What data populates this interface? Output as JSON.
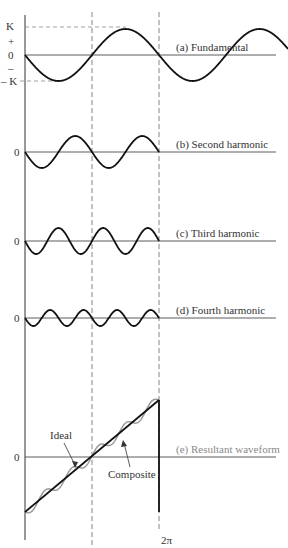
{
  "diagram": {
    "axis_labels": {
      "K": "K",
      "plus": "+",
      "zero": "0",
      "minus": "–",
      "neg_K": "– K",
      "two_pi": "2π"
    },
    "panels": [
      {
        "id": "a",
        "label": "(a) Fundamental",
        "harmonic": 1,
        "amplitude_px": 26,
        "baseline_y": 55
      },
      {
        "id": "b",
        "label": "(b) Second harmonic",
        "harmonic": 2,
        "amplitude_px": 16,
        "baseline_y": 152
      },
      {
        "id": "c",
        "label": "(c) Third harmonic",
        "harmonic": 3,
        "amplitude_px": 13,
        "baseline_y": 241
      },
      {
        "id": "d",
        "label": "(d) Fourth harmonic",
        "harmonic": 4,
        "amplitude_px": 8,
        "baseline_y": 318
      },
      {
        "id": "e",
        "label": "(e) Resultant waveform",
        "harmonic": 0,
        "baseline_y": 457
      }
    ],
    "annotations": {
      "ideal": "Ideal",
      "composite": "Composite"
    },
    "colors": {
      "curve": "#111111",
      "axis": "#333333",
      "dashed": "#666666",
      "composite": "#9a9a9a",
      "resultant_label": "#8a8a8a"
    }
  }
}
